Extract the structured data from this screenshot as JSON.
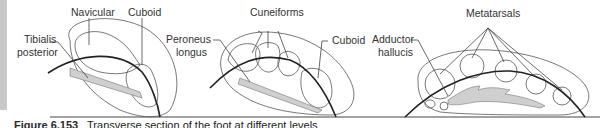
{
  "figure": {
    "caption_number": "Figure 6.153",
    "caption_text": "Transverse section of the foot at different levels",
    "panels": [
      {
        "id": "panel-1",
        "labels": {
          "navicular": "Navicular",
          "cuboid": "Cuboid",
          "tibialis_line1": "Tibialis",
          "tibialis_line2": "posterior"
        }
      },
      {
        "id": "panel-2",
        "labels": {
          "cuneiforms": "Cuneiforms",
          "cuboid": "Cuboid",
          "peroneus_line1": "Peroneus",
          "peroneus_line2": "longus"
        }
      },
      {
        "id": "panel-3",
        "labels": {
          "metatarsals": "Metatarsals",
          "adductor_line1": "Adductor",
          "adductor_line2": "hallucis"
        }
      }
    ]
  },
  "colors": {
    "sidebar": "#c8c8c8",
    "muscle_fill": "#cfcfcf",
    "outline": "#555555",
    "arch": "#222222"
  }
}
